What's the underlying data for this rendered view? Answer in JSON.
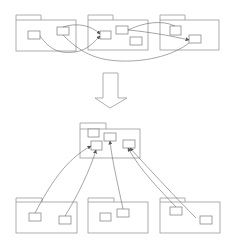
{
  "diagram": {
    "colors": {
      "outline": "#9a9a9a",
      "box": "#8a8a8a",
      "link": "#6a6a6a",
      "background": "#ffffff"
    },
    "top_packages": [
      {
        "id": "top-pkg-1",
        "x": 16,
        "y": 15,
        "tab_w": 25,
        "w": 60,
        "h": 36,
        "boxes": [
          {
            "x": 28,
            "y": 31,
            "w": 12,
            "h": 8
          },
          {
            "x": 57,
            "y": 27,
            "w": 12,
            "h": 8
          }
        ]
      },
      {
        "id": "top-pkg-2",
        "x": 88,
        "y": 15,
        "tab_w": 25,
        "w": 60,
        "h": 35,
        "boxes": [
          {
            "x": 100,
            "y": 31,
            "w": 11,
            "h": 8
          },
          {
            "x": 116,
            "y": 26,
            "w": 12,
            "h": 8
          },
          {
            "x": 130,
            "y": 37,
            "w": 12,
            "h": 8
          }
        ]
      },
      {
        "id": "top-pkg-3",
        "x": 160,
        "y": 15,
        "tab_w": 25,
        "w": 59,
        "h": 35,
        "boxes": [
          {
            "x": 170,
            "y": 26,
            "w": 11,
            "h": 9
          },
          {
            "x": 189,
            "y": 35,
            "w": 12,
            "h": 8
          }
        ]
      }
    ],
    "arrow": {
      "direction": "down",
      "shaft_x": 103,
      "shaft_w": 15,
      "top": 73,
      "head_y": 98,
      "head_left": 95,
      "head_right": 127,
      "tip_y": 108
    },
    "shared_package": {
      "id": "shared-pkg",
      "x": 80,
      "y": 123,
      "tab_w": 26,
      "w": 60,
      "h": 35,
      "boxes": [
        {
          "x": 88,
          "y": 129,
          "w": 11,
          "h": 8
        },
        {
          "x": 91,
          "y": 141,
          "w": 11,
          "h": 9
        },
        {
          "x": 104,
          "y": 133,
          "w": 12,
          "h": 8
        },
        {
          "x": 123,
          "y": 140,
          "w": 12,
          "h": 8
        }
      ]
    },
    "bottom_packages": [
      {
        "id": "bottom-pkg-1",
        "x": 16,
        "y": 198,
        "tab_w": 26,
        "w": 61,
        "h": 35,
        "boxes": [
          {
            "x": 29,
            "y": 213,
            "w": 12,
            "h": 8
          },
          {
            "x": 59,
            "y": 216,
            "w": 12,
            "h": 8
          }
        ]
      },
      {
        "id": "bottom-pkg-2",
        "x": 88,
        "y": 198,
        "tab_w": 26,
        "w": 60,
        "h": 35,
        "boxes": [
          {
            "x": 100,
            "y": 213,
            "w": 11,
            "h": 8
          },
          {
            "x": 117,
            "y": 209,
            "w": 12,
            "h": 8
          }
        ]
      },
      {
        "id": "bottom-pkg-3",
        "x": 160,
        "y": 198,
        "tab_w": 25,
        "w": 60,
        "h": 35,
        "boxes": [
          {
            "x": 170,
            "y": 207,
            "w": 12,
            "h": 8
          },
          {
            "x": 200,
            "y": 216,
            "w": 12,
            "h": 8
          }
        ]
      }
    ]
  }
}
